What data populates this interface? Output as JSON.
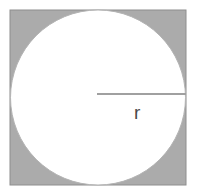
{
  "figure": {
    "name": "circle-inscribed-in-square",
    "canvas": {
      "width": 197,
      "height": 196,
      "background": "#ffffff"
    },
    "square": {
      "label": "shaded-square",
      "x": 10,
      "y": 10,
      "width": 176,
      "height": 175,
      "fill": "#ababab",
      "stroke": "#8e8e8e",
      "stroke_width": 1
    },
    "circle": {
      "label": "inscribed-circle",
      "cx": 98,
      "cy": 97.5,
      "r": 87.5,
      "fill": "#ffffff",
      "stroke": "#b4b4b4",
      "stroke_width": 1
    },
    "radius_line": {
      "label": "radius-segment",
      "x1": 97,
      "y1": 94,
      "x2": 186,
      "y2": 94,
      "stroke": "#a0a0a0",
      "stroke_width": 2
    },
    "radius_label": {
      "text": "r",
      "x": 134,
      "y": 119,
      "color": "#4a4a4a",
      "font_size": 19
    }
  }
}
